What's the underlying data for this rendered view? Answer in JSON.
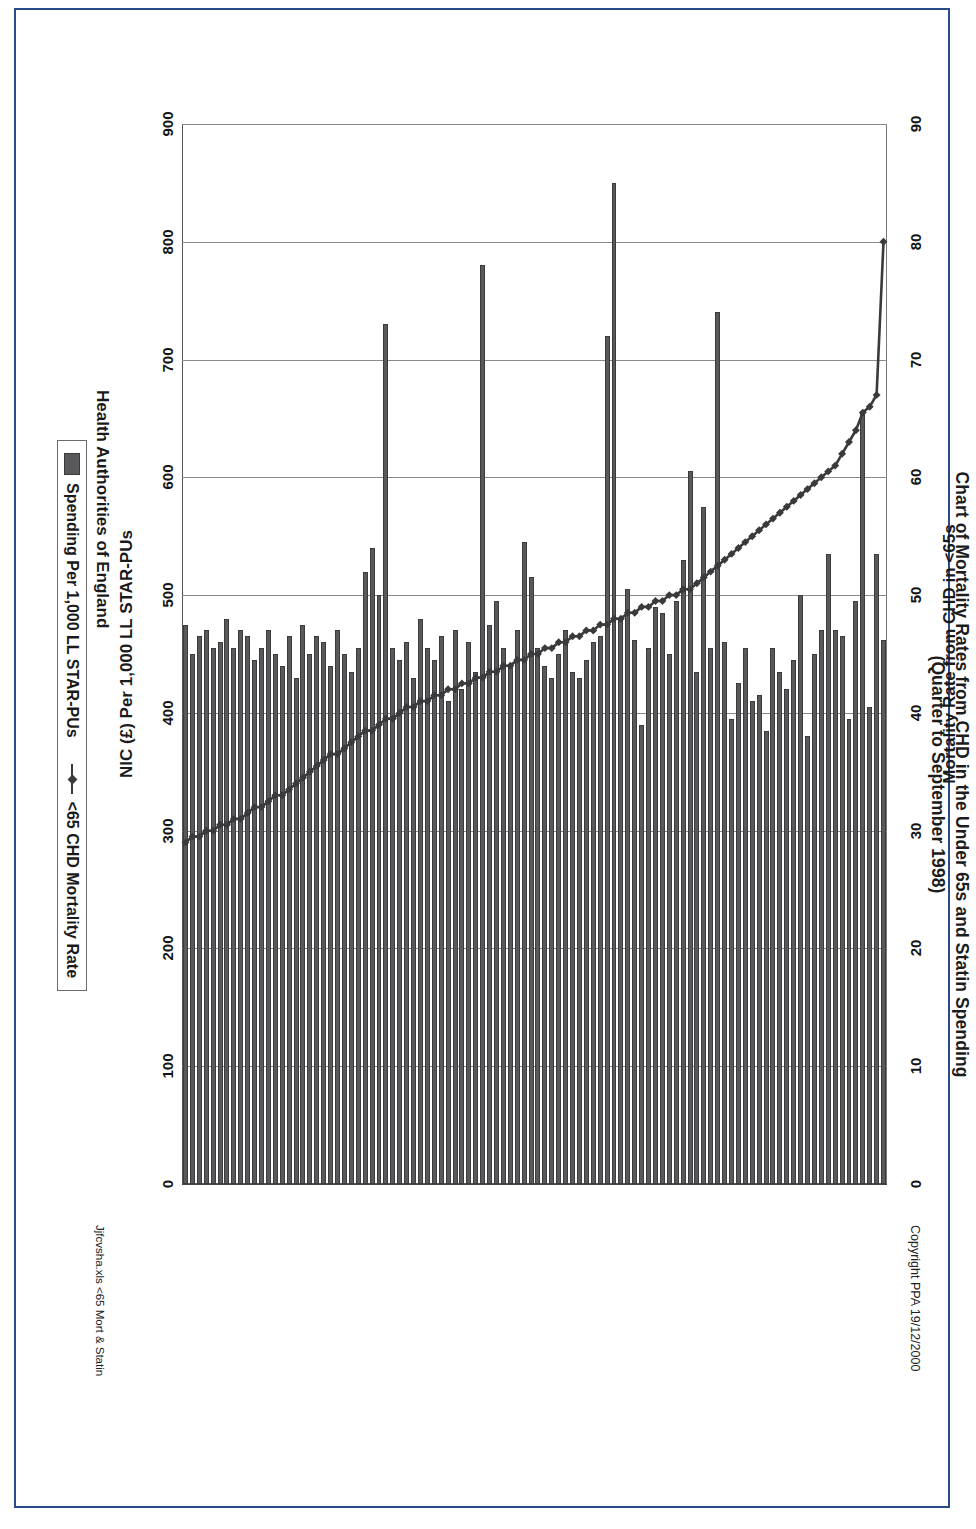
{
  "page": {
    "copyright": "Copyright PPA 19/12/2000",
    "footer_note": "Jjfcvsha.xls   <65 Mort & Statin",
    "frame_color": "#2a4a8a"
  },
  "chart_data": {
    "type": "bar",
    "title": "Chart of Mortality Rates from CHD in the Under 65s and Statin Spending",
    "subtitle": "(Quarter to September 1998)",
    "xlabel": "Health Authorities of England",
    "ylabel": "NIC (£) Per 1,000 LL STAR-PUs",
    "y2label": "Mortality Rate from CHD in <65s",
    "orientation": "horizontal-bars-rotated",
    "grid": true,
    "legend_position": "bottom",
    "ylim": [
      0,
      900
    ],
    "y2lim": [
      0,
      90
    ],
    "yticks": [
      0,
      100,
      200,
      300,
      400,
      500,
      600,
      700,
      800,
      900
    ],
    "y2ticks": [
      0,
      10,
      20,
      30,
      40,
      50,
      60,
      70,
      80,
      90
    ],
    "categories_label": "Health Authorities of England",
    "series": [
      {
        "name": "Spending Per 1,000 LL STAR-PUs",
        "type": "bar",
        "color": "#59595c",
        "values": [
          462,
          535,
          405,
          655,
          495,
          395,
          465,
          470,
          535,
          470,
          450,
          380,
          500,
          445,
          420,
          435,
          455,
          385,
          415,
          410,
          455,
          425,
          395,
          460,
          740,
          455,
          575,
          435,
          605,
          530,
          495,
          450,
          485,
          490,
          455,
          390,
          462,
          505,
          480,
          850,
          720,
          465,
          460,
          445,
          430,
          435,
          470,
          450,
          430,
          440,
          455,
          515,
          545,
          470,
          440,
          455,
          495,
          475,
          780,
          435,
          460,
          420,
          470,
          410,
          465,
          445,
          455,
          480,
          430,
          460,
          445,
          455,
          730,
          500,
          540,
          520,
          455,
          435,
          450,
          470,
          440,
          460,
          465,
          450,
          475,
          430,
          465,
          440,
          450,
          470,
          455,
          445,
          465,
          470,
          455,
          480,
          460,
          455,
          470,
          465,
          450,
          475
        ]
      },
      {
        "name": "<65 CHD Mortality Rate",
        "type": "line",
        "color": "#3a3a3d",
        "values": [
          80.0,
          67.0,
          66.0,
          65.5,
          64.0,
          63.0,
          62.0,
          61.0,
          60.5,
          60.0,
          59.5,
          59.0,
          58.5,
          58.0,
          57.5,
          57.0,
          56.5,
          56.0,
          55.5,
          55.0,
          54.5,
          54.0,
          53.5,
          53.0,
          52.5,
          52.0,
          51.5,
          51.0,
          50.5,
          50.5,
          50.0,
          50.0,
          49.5,
          49.5,
          49.0,
          49.0,
          48.5,
          48.5,
          48.0,
          48.0,
          47.5,
          47.5,
          47.0,
          47.0,
          46.5,
          46.5,
          46.0,
          46.0,
          45.5,
          45.5,
          45.0,
          45.0,
          44.5,
          44.5,
          44.0,
          44.0,
          43.5,
          43.5,
          43.0,
          43.0,
          42.5,
          42.5,
          42.0,
          42.0,
          41.5,
          41.5,
          41.0,
          41.0,
          40.5,
          40.5,
          40.0,
          39.5,
          39.5,
          39.0,
          38.5,
          38.5,
          38.0,
          37.5,
          37.0,
          36.5,
          36.5,
          36.0,
          35.5,
          35.0,
          34.5,
          34.0,
          33.5,
          33.0,
          33.0,
          32.5,
          32.0,
          32.0,
          31.5,
          31.0,
          31.0,
          30.5,
          30.5,
          30.0,
          30.0,
          29.5,
          29.5,
          29.0
        ]
      }
    ]
  }
}
